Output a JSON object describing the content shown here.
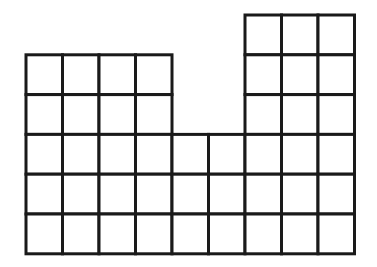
{
  "diagram": {
    "title": "",
    "stroke_color": "#1a1a1a",
    "fill_color": "#ffffff",
    "origin_x": 26,
    "origin_y": 15,
    "cell_width": 36.5,
    "cell_height": 39.8,
    "stroke_width": 3,
    "columns": [
      {
        "index": 0,
        "top_row": 1,
        "bottom_row": 5,
        "height_units": 5
      },
      {
        "index": 1,
        "top_row": 1,
        "bottom_row": 5,
        "height_units": 5
      },
      {
        "index": 2,
        "top_row": 1,
        "bottom_row": 5,
        "height_units": 5
      },
      {
        "index": 3,
        "top_row": 1,
        "bottom_row": 5,
        "height_units": 5
      },
      {
        "index": 4,
        "top_row": 3,
        "bottom_row": 5,
        "height_units": 3
      },
      {
        "index": 5,
        "top_row": 3,
        "bottom_row": 5,
        "height_units": 3
      },
      {
        "index": 6,
        "top_row": 0,
        "bottom_row": 5,
        "height_units": 6
      },
      {
        "index": 7,
        "top_row": 0,
        "bottom_row": 5,
        "height_units": 6
      },
      {
        "index": 8,
        "top_row": 0,
        "bottom_row": 5,
        "height_units": 6
      }
    ],
    "total_squares": 44
  }
}
